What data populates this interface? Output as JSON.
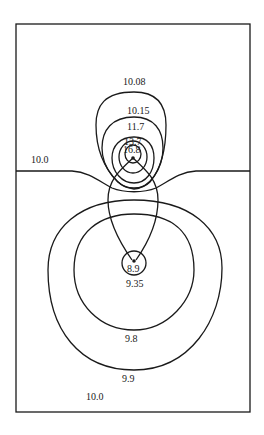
{
  "diagram": {
    "type": "contour-plot",
    "line_color": "#1a1a1a",
    "background": "#ffffff",
    "upper_source_labels": {
      "outer": "10.08",
      "second": "10.15",
      "third": "11.7",
      "fourth": "13.7",
      "inner": "16.8"
    },
    "boundary_label": "10.0",
    "lower_source_labels": {
      "inner": "8.9",
      "second": "9.35",
      "third": "9.8",
      "outer": "9.9",
      "far_field": "10.0"
    }
  }
}
